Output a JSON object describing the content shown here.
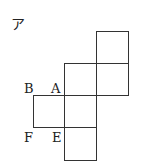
{
  "figure": {
    "title_label": "ア",
    "vertex_labels": {
      "B": "B",
      "A": "A",
      "F": "F",
      "E": "E"
    },
    "stroke_color": "#333333",
    "background": "#ffffff",
    "squares": [
      {
        "name": "top-right",
        "x": 96,
        "y": 31,
        "size": 32
      },
      {
        "name": "middle-left",
        "x": 64,
        "y": 63,
        "size": 32
      },
      {
        "name": "middle-right",
        "x": 96,
        "y": 63,
        "size": 32
      },
      {
        "name": "center",
        "x": 64,
        "y": 95,
        "size": 32
      },
      {
        "name": "left",
        "x": 33,
        "y": 95,
        "size": 32
      },
      {
        "name": "bottom",
        "x": 64,
        "y": 127,
        "size": 32
      }
    ]
  }
}
